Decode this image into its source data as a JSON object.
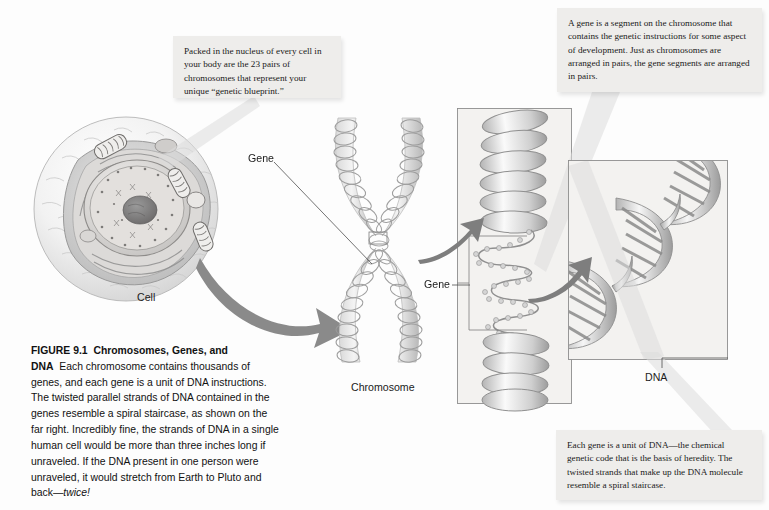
{
  "figure": {
    "id": "FIGURE 9.1",
    "title": "Chromosomes, Genes, and DNA",
    "caption_body": "Each chromosome contains thousands of genes, and each gene is a unit of DNA instructions. The twisted parallel strands of DNA contained in the genes resemble a spiral staircase, as shown on the far right. Incredibly fine, the strands of DNA in a single human cell would be more than three inches long if unraveled. If the DNA present in one person were unraveled, it would stretch from Earth to Pluto and back—",
    "caption_italic_tail": "twice!"
  },
  "callouts": {
    "nucleus": "Packed in the nucleus of every cell in your body are the 23 pairs of chromosomes that represent your unique “genetic blueprint.”",
    "gene": "A gene is a segment on the chromosome that contains the genetic instructions for some aspect of development. Just as chromosomes are arranged in pairs, the gene segments are arranged in pairs.",
    "dna": "Each gene is a unit of DNA—the chemical genetic code that is the basis of heredity. The twisted strands that make up the DNA molecule resemble a spiral staircase."
  },
  "labels": {
    "cell": "Cell",
    "gene_top": "Gene",
    "gene_mid": "Gene",
    "chromosome": "Chromosome",
    "dna": "DNA"
  },
  "colors": {
    "page_background": "#fdfdfd",
    "callout_background": "#eeedeb",
    "text": "#1a1a1a",
    "artwork_gray": "#8a8a8a",
    "panel_fill": "#f3f2f0",
    "panel_stroke": "#8e8e8e"
  }
}
